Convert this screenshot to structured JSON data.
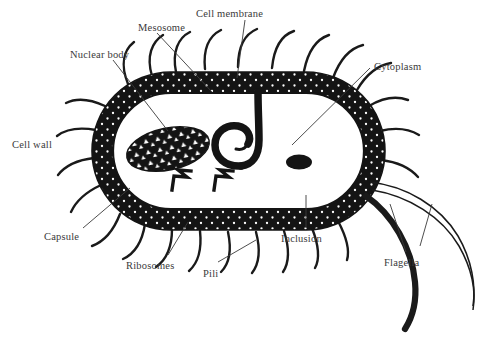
{
  "figure": {
    "background_color": "#ffffff",
    "ink_color": "#1a1a1a",
    "label_color": "#3a3a3a",
    "width": 490,
    "height": 342
  },
  "labels": [
    {
      "id": "mesosome",
      "text": "Mesosome",
      "x": 138,
      "y": 23
    },
    {
      "id": "cell-membrane",
      "text": "Cell membrane",
      "x": 196,
      "y": 9
    },
    {
      "id": "nuclear-body",
      "text": "Nuclear body",
      "x": 70,
      "y": 50
    },
    {
      "id": "cytoplasm",
      "text": "Cytoplasm",
      "x": 374,
      "y": 62
    },
    {
      "id": "cell-wall",
      "text": "Cell wall",
      "x": 12,
      "y": 140
    },
    {
      "id": "capsule",
      "text": "Capsule",
      "x": 44,
      "y": 232
    },
    {
      "id": "ribosomes",
      "text": "Ribosomes",
      "x": 126,
      "y": 261
    },
    {
      "id": "pili",
      "text": "Pili",
      "x": 203,
      "y": 269
    },
    {
      "id": "inclusion",
      "text": "Inclusion",
      "x": 281,
      "y": 234
    },
    {
      "id": "flagella",
      "text": "Flagella",
      "x": 384,
      "y": 258
    }
  ],
  "structures": [
    {
      "id": "cell-wall-band",
      "name": "cell wall",
      "shape": "stadium-ring",
      "fill": "#141414",
      "texture": "white-dot-stipple"
    },
    {
      "id": "cell-membrane",
      "name": "cell membrane",
      "shape": "inner-outline"
    },
    {
      "id": "cytoplasm",
      "name": "cytoplasm",
      "shape": "interior-void",
      "fill": "#ffffff"
    },
    {
      "id": "nuclear-body",
      "name": "nuclear body",
      "shape": "ellipse",
      "fill": "#141414",
      "texture": "white-chevrons"
    },
    {
      "id": "mesosome",
      "name": "mesosome",
      "shape": "membrane-infolding-loop",
      "fill": "#141414"
    },
    {
      "id": "inclusion",
      "name": "inclusion body",
      "shape": "ellipse",
      "fill": "#141414"
    },
    {
      "id": "ribosomes",
      "name": "ribosomes",
      "shape": "zigzag-marks",
      "count": 2
    },
    {
      "id": "capsule",
      "name": "capsule",
      "shape": "radiating-hairs"
    },
    {
      "id": "pili",
      "name": "pili",
      "shape": "curved-hairs"
    },
    {
      "id": "flagella",
      "name": "flagella",
      "shape": "long-whips",
      "count": 3
    }
  ]
}
